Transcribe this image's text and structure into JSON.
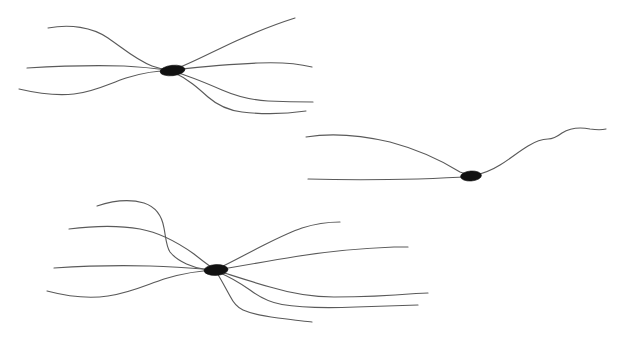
{
  "figure": {
    "background_color": "#ffffff",
    "neurite_color": "#5a5a5a",
    "soma_color": "#111111",
    "stroke_width": 1.15,
    "width": 632,
    "height": 338
  },
  "neurons": [
    {
      "id": "neuron-top-left",
      "label": "Top-left neuron",
      "soma": {
        "cx": 172.5,
        "cy": 70.5,
        "rx": 12.5,
        "ry": 5.2,
        "rotation": -6
      },
      "process_count": 7,
      "processes": [
        {
          "name": "process-tl-1",
          "direction": "left-upper",
          "endpoint": [
            48,
            28
          ],
          "path": "M 48 28 C 70 24 92 27 108 38 C 124 49 136 60 152 66 C 160 69 166 70 172 70.5"
        },
        {
          "name": "process-tl-2",
          "direction": "left-middle",
          "endpoint": [
            27,
            68
          ],
          "path": "M 27 68 C 60 66 96 65 124 66 C 144 67 160 69 172 70.5"
        },
        {
          "name": "process-tl-3",
          "direction": "left-lower",
          "endpoint": [
            19,
            89
          ],
          "path": "M 19 89 C 36 93 56 96 74 94 C 94 92 108 84 126 78 C 145 72 160 70.5 172 70.5"
        },
        {
          "name": "process-tl-4",
          "direction": "right-upper",
          "endpoint": [
            295,
            18
          ],
          "path": "M 173 70 C 192 63 212 52 236 41 C 258 31 276 24 295 18"
        },
        {
          "name": "process-tl-5",
          "direction": "right-flat-upper",
          "endpoint": [
            312,
            67
          ],
          "path": "M 173 70 C 200 67 230 64 258 63 C 282 62 300 64 312 67"
        },
        {
          "name": "process-tl-6",
          "direction": "right-lower",
          "endpoint": [
            313,
            102
          ],
          "path": "M 173 71.5 C 190 76 206 83 222 90 C 236 96 250 100 268 101 C 290 102 304 102 313 102"
        },
        {
          "name": "process-tl-7",
          "direction": "right-lowest",
          "endpoint": [
            306,
            111
          ],
          "path": "M 173 72 C 188 79 198 88 208 97 C 216 104 226 110 242 112 C 268 115 292 113 306 111"
        }
      ]
    },
    {
      "id": "neuron-middle-right",
      "label": "Middle-right bipolar neuron",
      "soma": {
        "cx": 471,
        "cy": 176,
        "rx": 10.5,
        "ry": 5.0,
        "rotation": -4
      },
      "process_count": 3,
      "processes": [
        {
          "name": "process-mr-1",
          "direction": "left-upper-long",
          "endpoint": [
            306,
            137
          ],
          "path": "M 306 137 C 330 133 360 135 390 142 C 420 150 444 162 460 172 C 465 174 468 175 470 176"
        },
        {
          "name": "process-mr-2",
          "direction": "left-lower-long",
          "endpoint": [
            308,
            179
          ],
          "path": "M 308 179 C 340 180 380 180 418 179 C 444 178 462 177 470 176.5"
        },
        {
          "name": "process-mr-3",
          "direction": "right-wavy-axon",
          "endpoint": [
            606,
            129
          ],
          "path": "M 472 176 C 482 174 492 170 500 165 C 510 159 518 152 528 146 C 536 141 542 139 548 139 C 554 139 558 136 562 133 C 570 128 580 127 590 129 C 597 130 602 130 606 129"
        }
      ]
    },
    {
      "id": "neuron-bottom-left",
      "label": "Bottom-left multipolar neuron",
      "soma": {
        "cx": 216,
        "cy": 270,
        "rx": 12.0,
        "ry": 5.4,
        "rotation": -3
      },
      "process_count": 9,
      "processes": [
        {
          "name": "process-bl-1",
          "direction": "left-top-hook",
          "endpoint": [
            97,
            206
          ],
          "path": "M 97 206 C 112 201 130 199 144 203 C 156 207 162 216 164 228 C 166 238 166 246 170 252 C 178 262 194 268 206 269.5 C 210 270 214 270 215 270"
        },
        {
          "name": "process-bl-2",
          "direction": "left-upper",
          "endpoint": [
            69,
            229
          ],
          "path": "M 69 229 C 92 226 118 225 140 229 C 162 233 180 244 194 254 C 204 262 211 267 215 270"
        },
        {
          "name": "process-bl-3",
          "direction": "left-flat",
          "endpoint": [
            54,
            268
          ],
          "path": "M 54 268 C 84 266 120 265 150 266 C 180 267 202 269 215 270"
        },
        {
          "name": "process-bl-4",
          "direction": "left-lower",
          "endpoint": [
            47,
            291
          ],
          "path": "M 47 291 C 66 296 88 299 108 296 C 130 293 146 285 164 279 C 184 273 204 270.5 215 270.5"
        },
        {
          "name": "process-bl-5",
          "direction": "right-upper-tip",
          "endpoint": [
            340,
            222
          ]
        },
        {
          "name": "process-bl-6",
          "direction": "right-flat",
          "endpoint": [
            408,
            247
          ]
        },
        {
          "name": "process-bl-7",
          "direction": "right-lower-long",
          "endpoint": [
            428,
            293
          ]
        },
        {
          "name": "process-bl-8",
          "direction": "right-lowest",
          "endpoint": [
            418,
            305
          ]
        },
        {
          "name": "process-bl-9",
          "direction": "down-hooked",
          "endpoint": [
            312,
            322
          ]
        }
      ]
    }
  ]
}
